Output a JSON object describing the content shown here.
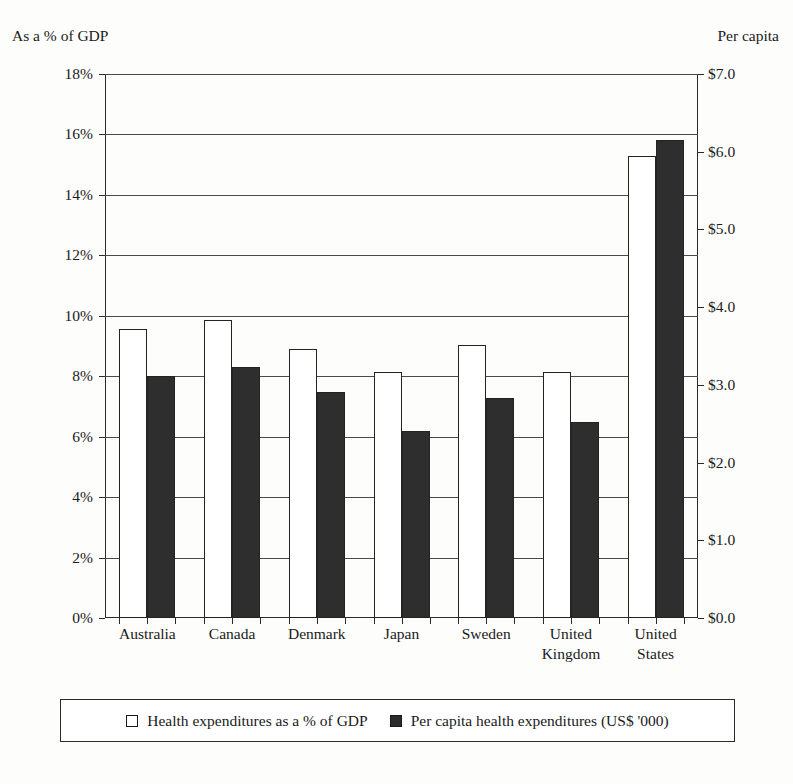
{
  "chart_data": {
    "type": "bar",
    "title": "",
    "subtitle": "",
    "left_axis_caption": "As a % of GDP",
    "right_axis_caption": "Per capita",
    "xlabel": "",
    "ylabel": "",
    "grid": true,
    "legend_position": "bottom",
    "categories": [
      "Australia",
      "Canada",
      "Denmark",
      "Japan",
      "Sweden",
      "United Kingdom",
      "United States"
    ],
    "category_label_lines": [
      [
        "Australia"
      ],
      [
        "Canada"
      ],
      [
        "Denmark"
      ],
      [
        "Japan"
      ],
      [
        "Sweden"
      ],
      [
        "United",
        "Kingdom"
      ],
      [
        "United",
        "States"
      ]
    ],
    "series": [
      {
        "name": "Health expenditures as a % of GDP",
        "axis": "left",
        "unit": "%",
        "color": "#ffffff",
        "marker": "open-square",
        "values": [
          9.55,
          9.85,
          8.9,
          8.15,
          9.05,
          8.15,
          15.3
        ]
      },
      {
        "name": "Per capita health expenditures (US$ '000)",
        "axis": "right",
        "unit": "US$ '000",
        "color": "#2e2e2e",
        "marker": "filled-square",
        "values": [
          3.11,
          3.23,
          2.91,
          2.41,
          2.83,
          2.52,
          6.15
        ]
      }
    ],
    "left_axis": {
      "min": 0,
      "max": 18,
      "step": 2,
      "ticks": [
        0,
        2,
        4,
        6,
        8,
        10,
        12,
        14,
        16,
        18
      ],
      "tick_labels": [
        "0%",
        "2%",
        "4%",
        "6%",
        "8%",
        "10%",
        "12%",
        "14%",
        "16%",
        "18%"
      ]
    },
    "right_axis": {
      "min": 0,
      "max": 7,
      "step": 1,
      "ticks": [
        0,
        1,
        2,
        3,
        4,
        5,
        6,
        7
      ],
      "tick_labels": [
        "$0.0",
        "$1.0",
        "$2.0",
        "$3.0",
        "$4.0",
        "$5.0",
        "$6.0",
        "$7.0"
      ]
    },
    "legend": [
      {
        "label": "Health expenditures as a % of GDP",
        "marker": "open-square"
      },
      {
        "label": "Per capita health expenditures (US$ '000)",
        "marker": "filled-square"
      }
    ]
  }
}
